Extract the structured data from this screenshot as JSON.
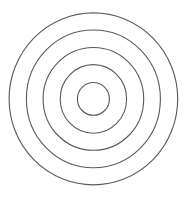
{
  "diagram": {
    "type": "concentric-circles",
    "ring_count": 5,
    "center": {
      "x": 93.4,
      "y": 98.9
    },
    "stroke_color": "#5a5a5a",
    "background": "#ffffff",
    "rings": [
      {
        "rx": 84.3,
        "ry": 86.0
      },
      {
        "rx": 67.0,
        "ry": 68.9
      },
      {
        "rx": 50.3,
        "ry": 51.4
      },
      {
        "rx": 33.2,
        "ry": 34.3
      },
      {
        "rx": 16.0,
        "ry": 16.4
      }
    ]
  }
}
